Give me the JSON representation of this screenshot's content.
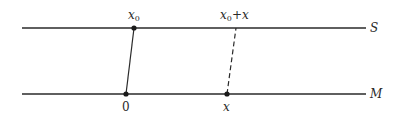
{
  "diagram": {
    "lines": [
      {
        "id": "S",
        "label": "S"
      },
      {
        "id": "M",
        "label": "M"
      }
    ],
    "points": {
      "top_left": {
        "base": "x",
        "sub": "0",
        "suffix": ""
      },
      "top_right": {
        "base": "x",
        "sub": "0",
        "suffix": "+x"
      },
      "bottom_left": {
        "label": "0"
      },
      "bottom_right": {
        "label": "x"
      }
    },
    "connectors": [
      {
        "from": "0",
        "to": "x0",
        "style": "solid"
      },
      {
        "from": "x",
        "to": "x0+x",
        "style": "dashed"
      }
    ],
    "colors": {
      "ink": "#2a2a2a",
      "background": "#ffffff"
    }
  }
}
